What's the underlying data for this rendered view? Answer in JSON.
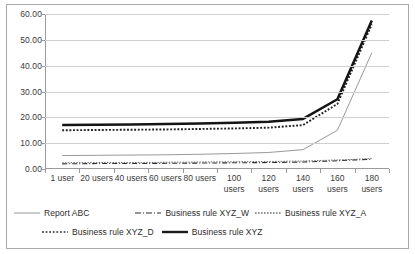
{
  "chart_data": {
    "type": "line",
    "title": "",
    "xlabel": "",
    "ylabel": "",
    "ylim": [
      0,
      60
    ],
    "ytick_step": 10,
    "grid": true,
    "legend_position": "bottom",
    "categories": [
      "1 user",
      "20 users",
      "40 users",
      "60 users",
      "80 users",
      "100 users",
      "120 users",
      "140 users",
      "160 users",
      "180 users"
    ],
    "ytick_labels": [
      "0.00",
      "10.00",
      "20.00",
      "30.00",
      "40.00",
      "50.00",
      "60.00"
    ],
    "series": [
      {
        "name": "Report ABC",
        "style": "thin-solid",
        "values": [
          5.2,
          5.3,
          5.4,
          5.5,
          5.7,
          6.0,
          6.4,
          7.5,
          15.0,
          45.0
        ]
      },
      {
        "name": "Business rule XYZ_W",
        "style": "dash-dot",
        "values": [
          2.0,
          2.1,
          2.1,
          2.2,
          2.3,
          2.4,
          2.5,
          2.7,
          3.2,
          3.8
        ]
      },
      {
        "name": "Business rule XYZ_A",
        "style": "fine-dotted",
        "values": [
          2.4,
          2.5,
          2.5,
          2.6,
          2.7,
          2.8,
          2.9,
          3.1,
          3.5,
          4.0
        ]
      },
      {
        "name": "Business rule XYZ_D",
        "style": "dotted",
        "values": [
          15.0,
          15.1,
          15.2,
          15.3,
          15.5,
          15.7,
          16.0,
          17.0,
          25.2,
          56.0
        ]
      },
      {
        "name": "Business rule XYZ",
        "style": "thick-solid",
        "values": [
          17.0,
          17.1,
          17.2,
          17.4,
          17.6,
          17.9,
          18.3,
          19.4,
          27.0,
          57.5
        ]
      }
    ]
  },
  "legend": {
    "items": [
      {
        "label": "Report ABC"
      },
      {
        "label": "Business rule XYZ_W"
      },
      {
        "label": "Business rule XYZ_A"
      },
      {
        "label": "Business rule XYZ_D"
      },
      {
        "label": "Business rule XYZ"
      }
    ]
  }
}
